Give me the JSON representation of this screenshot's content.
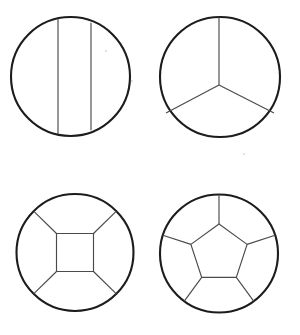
{
  "canvas": {
    "width": 300,
    "height": 335,
    "background": "#ffffff"
  },
  "style": {
    "circle_stroke": "#1c1c1c",
    "circle_stroke_width": 2.1,
    "divider_stroke": "#4a4a4a",
    "divider_stroke_width": 1.15,
    "fill": "#ffffff"
  },
  "figures": [
    {
      "id": "figure-1",
      "name": "circle-two-vertical-chords",
      "description": "Circle divided by two vertical parallel chords into three regions",
      "region_count": 3,
      "divider_kind": "parallel-chords",
      "circle": {
        "cx": 70.5,
        "cy": 76.5,
        "r": 59.5
      },
      "dividers": [
        {
          "name": "chord-left",
          "x1": 58,
          "y1": 18.8,
          "x2": 58,
          "y2": 134.2
        },
        {
          "name": "chord-right",
          "x1": 91,
          "y1": 22.8,
          "x2": 91,
          "y2": 130.2
        }
      ]
    },
    {
      "id": "figure-2",
      "name": "circle-three-radii",
      "description": "Circle divided by three radii meeting at an interior point into three regions",
      "region_count": 3,
      "divider_kind": "radii",
      "circle": {
        "cx": 220,
        "cy": 77,
        "r": 60
      },
      "hub": {
        "x": 219,
        "y": 85
      },
      "dividers": [
        {
          "name": "radius-up",
          "x1": 219,
          "y1": 85,
          "x2": 219,
          "y2": 17
        },
        {
          "name": "radius-lower-left",
          "x1": 219,
          "y1": 85,
          "x2": 166,
          "y2": 113
        },
        {
          "name": "radius-lower-right",
          "x1": 219,
          "y1": 85,
          "x2": 274,
          "y2": 113
        }
      ]
    },
    {
      "id": "figure-3",
      "name": "circle-inscribed-square",
      "description": "Circle with a central square and four diagonal spokes to the rim, five regions",
      "region_count": 5,
      "divider_kind": "inner-square-with-spokes",
      "circle": {
        "cx": 75,
        "cy": 252.5,
        "r": 58.5
      },
      "inner_polygon": {
        "name": "center-square",
        "points": [
          {
            "x": 56.5,
            "y": 233.5
          },
          {
            "x": 93.5,
            "y": 233.5
          },
          {
            "x": 93.5,
            "y": 271.5
          },
          {
            "x": 56.5,
            "y": 271.5
          }
        ]
      },
      "dividers": [
        {
          "name": "spoke-upper-left",
          "x1": 56.5,
          "y1": 233.5,
          "x2": 33.6,
          "y2": 211.1
        },
        {
          "name": "spoke-upper-right",
          "x1": 93.5,
          "y1": 233.5,
          "x2": 116.4,
          "y2": 211.1
        },
        {
          "name": "spoke-lower-right",
          "x1": 93.5,
          "y1": 271.5,
          "x2": 116.4,
          "y2": 293.9
        },
        {
          "name": "spoke-lower-left",
          "x1": 56.5,
          "y1": 271.5,
          "x2": 33.6,
          "y2": 293.9
        }
      ]
    },
    {
      "id": "figure-4",
      "name": "circle-inscribed-pentagon",
      "description": "Circle with a central pentagon and five spokes to the rim, six regions",
      "region_count": 6,
      "divider_kind": "inner-pentagon-with-spokes",
      "circle": {
        "cx": 219,
        "cy": 253.5,
        "r": 59
      },
      "inner_polygon": {
        "name": "center-pentagon",
        "points": [
          {
            "x": 219,
            "y": 224
          },
          {
            "x": 247.1,
            "y": 244.4
          },
          {
            "x": 236.3,
            "y": 277.4
          },
          {
            "x": 201.7,
            "y": 277.4
          },
          {
            "x": 190.9,
            "y": 244.4
          }
        ]
      },
      "dividers": [
        {
          "name": "spoke-top",
          "x1": 219,
          "y1": 224,
          "x2": 219,
          "y2": 194.5
        },
        {
          "name": "spoke-upper-right",
          "x1": 247.1,
          "y1": 244.4,
          "x2": 275.1,
          "y2": 235.3
        },
        {
          "name": "spoke-lower-right",
          "x1": 236.3,
          "y1": 277.4,
          "x2": 253.7,
          "y2": 301.2
        },
        {
          "name": "spoke-lower-left",
          "x1": 201.7,
          "y1": 277.4,
          "x2": 184.3,
          "y2": 301.2
        },
        {
          "name": "spoke-upper-left",
          "x1": 190.9,
          "y1": 244.4,
          "x2": 162.9,
          "y2": 235.3
        }
      ]
    }
  ],
  "specks": [
    {
      "name": "speck-a",
      "x": 131,
      "y": 80
    },
    {
      "name": "speck-b",
      "x": 105,
      "y": 50
    },
    {
      "name": "speck-c",
      "x": 243,
      "y": 153
    }
  ]
}
